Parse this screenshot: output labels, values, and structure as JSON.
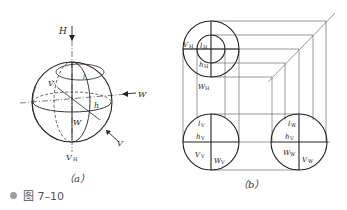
{
  "figure": {
    "caption_number": "图 7–10",
    "subfig_a_label": "（a）",
    "subfig_b_label": "（b）"
  },
  "subfig_a": {
    "labels": {
      "H": "H",
      "V": "V",
      "W": "W",
      "h": "h",
      "V_arrow": "V",
      "W_arrow": "W",
      "VH_main": "V",
      "VH_sub": "H",
      "top_sub": "l"
    }
  },
  "subfig_b": {
    "top_view": {
      "VH": {
        "main": "V",
        "sub": "H"
      },
      "lH": {
        "main": "l",
        "sub": "H"
      },
      "hH": {
        "main": "h",
        "sub": "H"
      },
      "WH": {
        "main": "W",
        "sub": "H"
      }
    },
    "front_view": {
      "lV": {
        "main": "l",
        "sub": "V"
      },
      "hV": {
        "main": "h",
        "sub": "V"
      },
      "VV": {
        "main": "V",
        "sub": "V"
      },
      "WV": {
        "main": "W",
        "sub": "V"
      }
    },
    "side_view": {
      "lW": {
        "main": "l",
        "sub": "W"
      },
      "hV": {
        "main": "h",
        "sub": "V"
      },
      "WW": {
        "main": "W",
        "sub": "W"
      },
      "VW": {
        "main": "V",
        "sub": "W"
      }
    }
  }
}
